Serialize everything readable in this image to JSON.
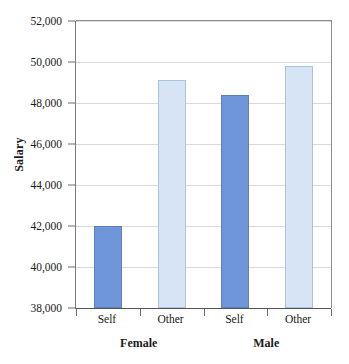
{
  "chart_data": {
    "type": "bar",
    "title": "",
    "xlabel": "",
    "ylabel": "Salary",
    "ylim": [
      38000,
      52000
    ],
    "ytick_step": 2000,
    "ytick_labels": [
      "38,000",
      "40,000",
      "42,000",
      "44,000",
      "46,000",
      "48,000",
      "50,000",
      "52,000"
    ],
    "ytick_values": [
      38000,
      40000,
      42000,
      44000,
      46000,
      48000,
      50000,
      52000
    ],
    "grid": true,
    "legend": "none",
    "categories": [
      "Self",
      "Other",
      "Self",
      "Other"
    ],
    "groups": [
      "Female",
      "Male"
    ],
    "group_spans": [
      [
        "Self",
        "Other"
      ],
      [
        "Self",
        "Other"
      ]
    ],
    "values": [
      42000,
      49100,
      48400,
      49800
    ],
    "bar_styles": [
      "dark",
      "light",
      "dark",
      "light"
    ],
    "colors": {
      "dark_bar_fill": "#6E96D8",
      "dark_bar_border": "#5C7FBD",
      "light_bar_fill": "#D6E4F5",
      "light_bar_border": "#A9C2DE",
      "gridline": "#D9D9D9",
      "axis": "#555555",
      "text": "#1A1A1A",
      "background": "#FFFFFF"
    },
    "bars": [
      {
        "group": "Female",
        "category": "Self",
        "value": 42000,
        "style": "dark"
      },
      {
        "group": "Female",
        "category": "Other",
        "value": 49100,
        "style": "light"
      },
      {
        "group": "Male",
        "category": "Self",
        "value": 48400,
        "style": "dark"
      },
      {
        "group": "Male",
        "category": "Other",
        "value": 49800,
        "style": "light"
      }
    ]
  },
  "axis": {
    "y_title": "Salary",
    "y_labels": {
      "t0": "38,000",
      "t1": "40,000",
      "t2": "42,000",
      "t3": "44,000",
      "t4": "46,000",
      "t5": "48,000",
      "t6": "50,000",
      "t7": "52,000"
    },
    "x_labels": {
      "c0": "Self",
      "c1": "Other",
      "c2": "Self",
      "c3": "Other"
    },
    "group_labels": {
      "g0": "Female",
      "g1": "Male"
    }
  }
}
